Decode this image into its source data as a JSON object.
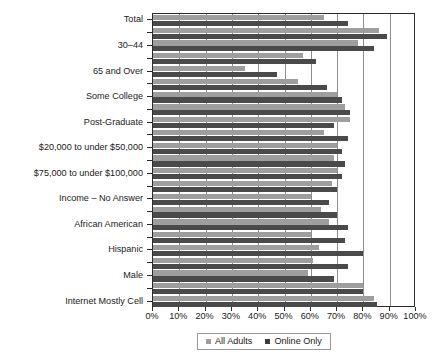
{
  "chart_data": {
    "type": "bar",
    "orientation": "horizontal",
    "title": "",
    "xlabel": "",
    "ylabel": "",
    "xlim": [
      0,
      100
    ],
    "xtick_labels": [
      "0%",
      "10%",
      "20%",
      "30%",
      "40%",
      "50%",
      "60%",
      "70%",
      "80%",
      "90%",
      "100%"
    ],
    "xtick_values": [
      0,
      10,
      20,
      30,
      40,
      50,
      60,
      70,
      80,
      90,
      100
    ],
    "grid": true,
    "grid_axis": "x",
    "legend_position": "bottom",
    "categories": [
      "Total",
      "18–29",
      "30–44",
      "45–64",
      "65 and Over",
      "High School or Less",
      "Some College",
      "College Graduate",
      "Post-Graduate",
      "Under $20,000",
      "$20,000 to under $50,000",
      "$50,000 to under $75,000",
      "$75,000 to under $100,000",
      "$100,000 or More",
      "Income – No Answer",
      "White",
      "African American",
      "Other Race",
      "Hispanic",
      "Female",
      "Male",
      "Internet Mostly Computer",
      "Internet Mostly Cell"
    ],
    "labeled_categories": [
      "Total",
      "30–44",
      "65 and Over",
      "Some College",
      "Post-Graduate",
      "$20,000 to under $50,000",
      "$75,000 to under $100,000",
      "Income – No Answer",
      "African American",
      "Hispanic",
      "Male",
      "Internet Mostly Cell"
    ],
    "series": [
      {
        "name": "All Adults",
        "color": "#9e9e9e",
        "values": [
          65,
          86,
          78,
          57,
          35,
          55,
          70,
          73,
          75,
          65,
          70,
          69,
          70,
          68,
          60,
          64,
          67,
          60,
          63,
          61,
          59,
          80,
          84
        ]
      },
      {
        "name": "Online Only",
        "color": "#4a4a4a",
        "values": [
          74,
          89,
          84,
          62,
          47,
          66,
          72,
          75,
          69,
          74,
          72,
          73,
          72,
          70,
          67,
          70,
          74,
          73,
          80,
          74,
          69,
          80,
          85
        ]
      }
    ]
  },
  "legend": {
    "entries": [
      {
        "label": "All Adults",
        "swatch": "light"
      },
      {
        "label": "Online Only",
        "swatch": "dark"
      }
    ]
  }
}
